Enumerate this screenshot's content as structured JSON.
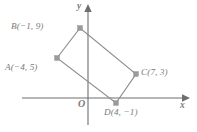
{
  "figure": {
    "kind": "coordinate-plane-quadrilateral",
    "background_color": "#ffffff",
    "axes": {
      "x_axis_label": "x",
      "y_axis_label": "y",
      "origin_label": "O",
      "axis_color": "#6e6e6e",
      "x_axis_pixel_y": 98,
      "y_axis_pixel_x": 88,
      "x_axis_pixel_start": 22,
      "x_axis_pixel_end": 185,
      "y_axis_pixel_start": 8,
      "y_axis_pixel_end": 125,
      "ticks_shown": false,
      "gridlines_shown": false,
      "units_per_pixel": 7
    },
    "shape": {
      "name": "quadrilateral-ABCD",
      "edge_color": "#8c8c8c",
      "vertex_marker_color": "#9a9a9a",
      "filled": false,
      "closed": true,
      "vertex_order": [
        "A",
        "B",
        "C",
        "D"
      ],
      "points": [
        {
          "id": "A",
          "label": "A(−4, 5)",
          "x": -4,
          "y": 5,
          "pixel_x": 57,
          "pixel_y": 58,
          "label_position": "below-left"
        },
        {
          "id": "B",
          "label": "B(−1, 9)",
          "x": -1,
          "y": 9,
          "pixel_x": 80,
          "pixel_y": 28,
          "label_position": "left"
        },
        {
          "id": "C",
          "label": "C(7, 3)",
          "x": 7,
          "y": 3,
          "pixel_x": 136,
          "pixel_y": 74,
          "label_position": "right"
        },
        {
          "id": "D",
          "label": "D(4, −1)",
          "x": 4,
          "y": -1,
          "pixel_x": 116,
          "pixel_y": 103,
          "label_position": "below"
        }
      ]
    }
  }
}
